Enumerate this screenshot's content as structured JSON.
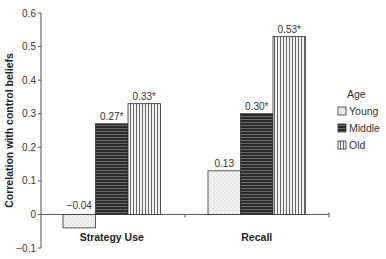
{
  "chart_data": {
    "type": "bar",
    "title": "",
    "xlabel": "",
    "ylabel": "Correlation with control beliefs",
    "ylim": [
      -0.1,
      0.6
    ],
    "yticks": [
      -0.1,
      0,
      0.1,
      0.2,
      0.3,
      0.4,
      0.5,
      0.6
    ],
    "ytick_labels": [
      "−0.1",
      "0",
      "0.1",
      "0.2",
      "0.3",
      "0.4",
      "0.5",
      "0.6"
    ],
    "categories": [
      "Strategy Use",
      "Recall"
    ],
    "series": [
      {
        "name": "Young",
        "pattern": "dots",
        "values": [
          -0.04,
          0.13
        ],
        "labels": [
          "−0.04",
          "0.13"
        ]
      },
      {
        "name": "Middle",
        "pattern": "horizontal-lines",
        "values": [
          0.27,
          0.3
        ],
        "labels": [
          "0.27*",
          "0.30*"
        ]
      },
      {
        "name": "Old",
        "pattern": "vertical-lines",
        "values": [
          0.33,
          0.53
        ],
        "labels": [
          "0.33*",
          "0.53*"
        ]
      }
    ],
    "legend": {
      "title": "Age",
      "placement": "right"
    },
    "grid": false
  }
}
